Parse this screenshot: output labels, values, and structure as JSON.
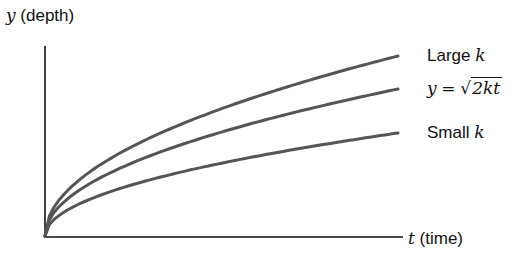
{
  "figure": {
    "y_axis_label": {
      "var": "y",
      "text": "(depth)"
    },
    "x_axis_label": {
      "var": "t",
      "text": "(time)"
    },
    "legend": {
      "large": {
        "text": "Large",
        "var": "k"
      },
      "equation": {
        "lhs": "y",
        "eq": "=",
        "rad": "√",
        "arg": "2kt"
      },
      "small": {
        "text": "Small",
        "var": "k"
      }
    }
  },
  "chart_data": {
    "type": "line",
    "title": "",
    "xlabel": "t (time)",
    "ylabel": "y (depth)",
    "grid": false,
    "ticks": false,
    "series": [
      {
        "name": "Large k",
        "formula": "y = sqrt(2 k_large t)",
        "color": "#555555",
        "end_y_px": 56
      },
      {
        "name": "y = sqrt(2kt)",
        "formula": "y = sqrt(2 k t)",
        "color": "#555555",
        "end_y_px": 89
      },
      {
        "name": "Small k",
        "formula": "y = sqrt(2 k_small t)",
        "color": "#555555",
        "end_y_px": 133
      }
    ],
    "origin_px": [
      45,
      236
    ],
    "x_end_px": 398,
    "axis_color": "#111111"
  }
}
